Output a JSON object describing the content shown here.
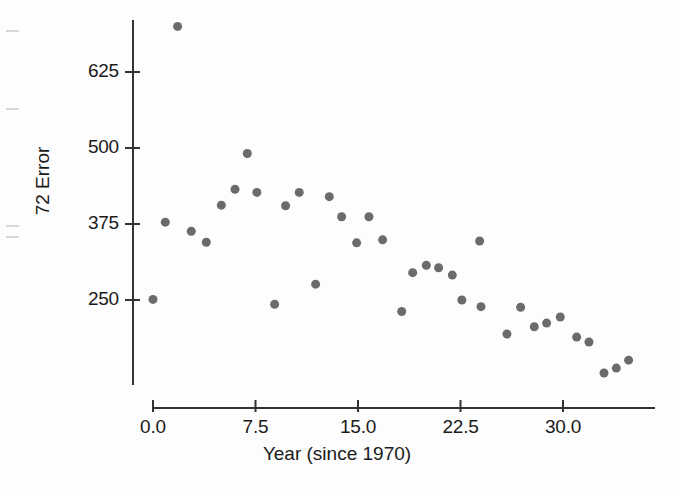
{
  "chart_data": {
    "type": "scatter",
    "title": "",
    "xlabel": "Year (since 1970)",
    "ylabel": "72 Error",
    "xticks": [
      0.0,
      7.5,
      15.0,
      22.5,
      30.0
    ],
    "xtick_labels": [
      "0.0",
      "7.5",
      "15.0",
      "22.5",
      "30.0"
    ],
    "yticks": [
      250,
      375,
      500,
      625
    ],
    "ytick_labels": [
      "250",
      "375",
      "500",
      "625"
    ],
    "xlim": [
      -1.2,
      36.5
    ],
    "ylim": [
      105,
      720
    ],
    "grid": false,
    "legend": null,
    "marker_color": "#6b6b6b",
    "marker_size": 9,
    "axis_color": "#333333",
    "points": [
      {
        "x": 0.0,
        "y": 251
      },
      {
        "x": 0.9,
        "y": 378
      },
      {
        "x": 1.8,
        "y": 700
      },
      {
        "x": 2.8,
        "y": 363
      },
      {
        "x": 3.9,
        "y": 345
      },
      {
        "x": 5.0,
        "y": 406
      },
      {
        "x": 6.0,
        "y": 432
      },
      {
        "x": 6.9,
        "y": 491
      },
      {
        "x": 7.6,
        "y": 427
      },
      {
        "x": 8.9,
        "y": 243
      },
      {
        "x": 9.7,
        "y": 405
      },
      {
        "x": 10.7,
        "y": 427
      },
      {
        "x": 11.9,
        "y": 276
      },
      {
        "x": 12.9,
        "y": 420
      },
      {
        "x": 13.8,
        "y": 387
      },
      {
        "x": 14.9,
        "y": 344
      },
      {
        "x": 15.8,
        "y": 387
      },
      {
        "x": 16.8,
        "y": 349
      },
      {
        "x": 18.2,
        "y": 231
      },
      {
        "x": 19.0,
        "y": 295
      },
      {
        "x": 20.0,
        "y": 307
      },
      {
        "x": 20.9,
        "y": 303
      },
      {
        "x": 21.9,
        "y": 291
      },
      {
        "x": 22.6,
        "y": 250
      },
      {
        "x": 23.9,
        "y": 347
      },
      {
        "x": 24.0,
        "y": 239
      },
      {
        "x": 25.9,
        "y": 194
      },
      {
        "x": 26.9,
        "y": 238
      },
      {
        "x": 27.9,
        "y": 206
      },
      {
        "x": 28.8,
        "y": 212
      },
      {
        "x": 29.8,
        "y": 222
      },
      {
        "x": 31.0,
        "y": 189
      },
      {
        "x": 31.9,
        "y": 181
      },
      {
        "x": 33.0,
        "y": 130
      },
      {
        "x": 33.9,
        "y": 138
      },
      {
        "x": 34.8,
        "y": 151
      }
    ]
  },
  "axes": {
    "y_axis_top_px": 20,
    "y_axis_bottom_px": 385,
    "x_axis_left_px": 153,
    "x_axis_right_px": 655,
    "x_axis_y_px": 408,
    "y_axis_x_px": 133
  }
}
